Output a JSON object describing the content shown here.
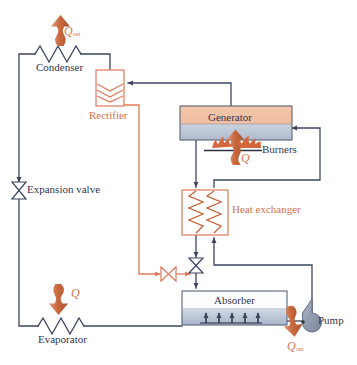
{
  "diagram": {
    "colors": {
      "line_blue": "#3c4560",
      "line_orange": "#e0795a",
      "text_blue": "#30364f",
      "text_orange": "#d4724a",
      "generator_top": "#f2bfa4",
      "generator_bottom": "#b9c4d6",
      "absorber_top": "#ffffff",
      "absorber_bottom": "#b9c4d6",
      "flame_orange": "#d4663a",
      "pump_gray": "#8e97ad",
      "arrow_orange": "#c2693f"
    },
    "components": [
      {
        "id": "condenser",
        "label": "Condenser",
        "kind": "coil-zigzag",
        "color": "blue"
      },
      {
        "id": "rectifier",
        "label": "Rectifier",
        "kind": "box-chevron",
        "color": "orange"
      },
      {
        "id": "generator",
        "label": "Generator",
        "kind": "box-vessel",
        "color": "blue"
      },
      {
        "id": "burners",
        "label": "Burners",
        "kind": "flames",
        "color": "orange"
      },
      {
        "id": "heat-exchanger",
        "label": "Heat exchanger",
        "kind": "box-coils",
        "color": "orange"
      },
      {
        "id": "expansion-valve",
        "label": "Expansion valve",
        "kind": "valve",
        "color": "blue"
      },
      {
        "id": "evaporator",
        "label": "Evaporator",
        "kind": "coil-zigzag",
        "color": "blue"
      },
      {
        "id": "absorber",
        "label": "Absorber",
        "kind": "box-vessel",
        "color": "blue"
      },
      {
        "id": "pump",
        "label": "Pump",
        "kind": "pump",
        "color": "blue"
      }
    ],
    "heat_flows": [
      {
        "id": "q-out-condenser",
        "symbol": "Q",
        "subscript": "out",
        "direction": "up",
        "at": "condenser"
      },
      {
        "id": "q-in-burners",
        "symbol": "Q",
        "subscript": "",
        "direction": "up",
        "at": "burners"
      },
      {
        "id": "q-in-evaporator",
        "symbol": "Q",
        "subscript": "",
        "direction": "down",
        "at": "evaporator"
      },
      {
        "id": "q-out-absorber",
        "symbol": "Q",
        "subscript": "out",
        "direction": "down",
        "at": "absorber"
      }
    ],
    "labels": {
      "condenser": "Condenser",
      "rectifier": "Rectifier",
      "generator": "Generator",
      "burners": "Burners",
      "heat_exchanger": "Heat exchanger",
      "expansion_valve": "Expansion valve",
      "evaporator": "Evaporator",
      "absorber": "Absorber",
      "pump": "Pump",
      "q_symbol": "Q",
      "q_out_sub": "out"
    },
    "valves": [
      {
        "id": "expansion-valve-main",
        "orientation": "vertical",
        "color": "blue"
      },
      {
        "id": "solution-valve-vertical",
        "orientation": "vertical",
        "color": "blue"
      },
      {
        "id": "rectifier-valve",
        "orientation": "horizontal",
        "color": "orange"
      }
    ]
  }
}
